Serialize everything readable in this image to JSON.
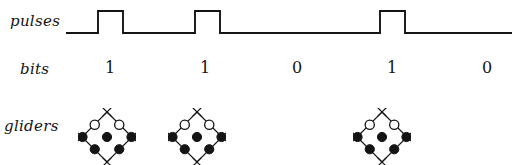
{
  "figure": {
    "background": "#ffffff",
    "ink_color": "#141414",
    "width": 512,
    "height": 165
  },
  "rows": {
    "pulses_label": "pulses",
    "bits_label": "bits",
    "gliders_label": "gliders"
  },
  "bits": {
    "values": [
      "1",
      "1",
      "0",
      "1",
      "0"
    ],
    "x_positions": [
      110,
      205,
      297,
      392,
      487
    ]
  },
  "chart_data": {
    "type": "line",
    "title": "",
    "xlabel": "",
    "ylabel": "",
    "series": [
      {
        "name": "pulses",
        "kind": "square-wave",
        "baseline_y": 33,
        "high_y": 11,
        "x_start": 66,
        "x_end": 512,
        "pulses": [
          {
            "rise": 98,
            "fall": 123
          },
          {
            "rise": 195,
            "fall": 220
          },
          {
            "rise": 380,
            "fall": 405
          }
        ]
      }
    ],
    "categories": [
      "1",
      "1",
      "0",
      "1",
      "0"
    ],
    "values": [
      1,
      1,
      0,
      1,
      0
    ],
    "grid": false,
    "legend": "none",
    "annotations": [
      "pulses waveform: high pulse for bit 1, low for bit 0",
      "gliders drawn only under bits equal to 1"
    ]
  },
  "gliders": {
    "count": 3,
    "x_positions": [
      82,
      172,
      357
    ],
    "y": 112,
    "size": 50,
    "cell_markers": {
      "alive": "filled-circle",
      "dead": "open-circle",
      "corner": "x-mark"
    },
    "pattern_name": "glider",
    "cells": {
      "alive": [
        [
          1,
          1
        ],
        [
          2,
          1
        ],
        [
          0,
          2
        ],
        [
          1,
          2
        ],
        [
          2,
          0
        ]
      ],
      "dead": [
        [
          1,
          0
        ],
        [
          0,
          1
        ]
      ]
    }
  }
}
